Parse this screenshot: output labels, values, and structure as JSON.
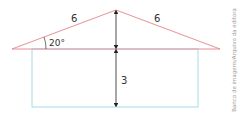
{
  "diagram": {
    "roof_left_label": "6",
    "roof_right_label": "6",
    "angle_label": "20°",
    "wall_height_label": "3",
    "credit": "Banco de imagens/Arquivo da editora",
    "colors": {
      "roof": "#e8828a",
      "wall": "#8fd3df",
      "arrow": "#222222"
    }
  }
}
